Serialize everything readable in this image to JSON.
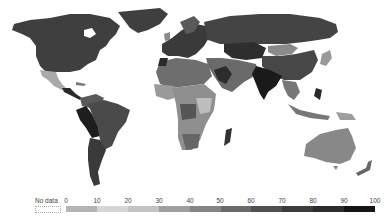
{
  "map": {
    "type": "choropleth world map",
    "scale_min": 0,
    "scale_max": 100,
    "regions": [
      {
        "name": "North America (USA/Canada)",
        "shade": "#3f3f3f"
      },
      {
        "name": "Greenland",
        "shade": "#3f3f3f"
      },
      {
        "name": "Mexico",
        "shade": "#a9a9a9"
      },
      {
        "name": "Central America",
        "shade": "#2a2a2a"
      },
      {
        "name": "Brazil",
        "shade": "#4a4a4a"
      },
      {
        "name": "Peru/Bolivia",
        "shade": "#1e1e1e"
      },
      {
        "name": "Argentina/Chile",
        "shade": "#3a3a3a"
      },
      {
        "name": "Colombia/Venezuela",
        "shade": "#5a5a5a"
      },
      {
        "name": "Europe",
        "shade": "#3a3a3a"
      },
      {
        "name": "Russia",
        "shade": "#444444"
      },
      {
        "name": "Central Asia",
        "shade": "#2e2e2e"
      },
      {
        "name": "Mongolia",
        "shade": "#8a8a8a"
      },
      {
        "name": "China",
        "shade": "#474747"
      },
      {
        "name": "India",
        "shade": "#1a1a1a"
      },
      {
        "name": "Middle East",
        "shade": "#6a6a6a"
      },
      {
        "name": "North Africa",
        "shade": "#6e6e6e"
      },
      {
        "name": "Sub-Saharan Africa",
        "shade": "#8f8f8f"
      },
      {
        "name": "Madagascar",
        "shade": "#333333"
      },
      {
        "name": "Southeast Asia",
        "shade": "#777777"
      },
      {
        "name": "Japan",
        "shade": "#9a9a9a"
      },
      {
        "name": "Australia",
        "shade": "#888888"
      },
      {
        "name": "New Zealand",
        "shade": "#666666"
      }
    ]
  },
  "legend": {
    "no_data_label": "No data",
    "ticks": [
      "0",
      "10",
      "20",
      "30",
      "40",
      "50",
      "60",
      "70",
      "80",
      "90",
      "100"
    ],
    "colors": [
      "#b4b4b4",
      "#d6d6d6",
      "#c4c4c4",
      "#9e9e9e",
      "#858585",
      "#6a6a6a",
      "#505050",
      "#3c3c3c",
      "#2c2c2c",
      "#141414"
    ]
  }
}
